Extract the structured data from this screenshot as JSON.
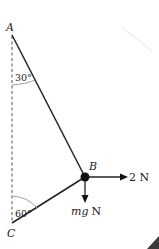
{
  "diagram": {
    "points": {
      "A": {
        "label": "A",
        "x": 12,
        "y": 33
      },
      "B": {
        "label": "B",
        "x": 85,
        "y": 177
      },
      "C": {
        "label": "C",
        "x": 12,
        "y": 225
      }
    },
    "angles": {
      "at_A": "30°",
      "at_C": "60°"
    },
    "forces": {
      "horizontal": {
        "label": "2 N",
        "direction": "right"
      },
      "weight": {
        "label_italic": "mg",
        "label_unit": "N",
        "direction": "down"
      }
    },
    "colors": {
      "line": "#222222",
      "dashed": "#555555",
      "corner": "#3a3a3a"
    }
  }
}
